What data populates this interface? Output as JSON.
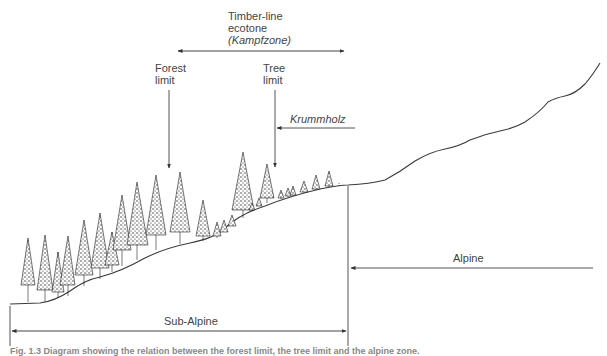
{
  "figure": {
    "title_lines": [
      "Timber-line",
      "ecotone",
      "(Kampfzone)"
    ],
    "labels": {
      "forest_limit": [
        "Forest",
        "limit"
      ],
      "tree_limit": [
        "Tree",
        "limit"
      ],
      "krummholz": "Krummholz",
      "alpine": "Alpine",
      "sub_alpine": "Sub-Alpine"
    },
    "caption": "Fig. 1.3 Diagram showing the relation between the forest limit, the tree limit and the alpine zone.",
    "colors": {
      "line": "#3a3a3a",
      "tree": "#2a2a2a",
      "text": "#444444"
    },
    "zones": [
      {
        "name": "Sub-Alpine",
        "x_from": 10,
        "x_to": 348
      },
      {
        "name": "Alpine",
        "x_from": 348,
        "x_to": 600
      },
      {
        "name": "Timber-line ecotone (Kampfzone)",
        "x_from": 177,
        "x_to": 344
      }
    ]
  }
}
